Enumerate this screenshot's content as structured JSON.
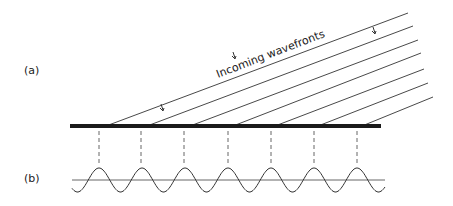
{
  "labels": {
    "a": "(a)",
    "b": "(b)",
    "incoming": "Incoming wavefronts"
  },
  "colors": {
    "line": "#333333",
    "bar": "#1a1a1a"
  },
  "wavefronts": [
    {
      "x1": 106,
      "y1": 126,
      "x2": 408,
      "y2": 13
    },
    {
      "x1": 147,
      "y1": 126,
      "x2": 413,
      "y2": 26
    },
    {
      "x1": 190,
      "y1": 126,
      "x2": 418,
      "y2": 40
    },
    {
      "x1": 233,
      "y1": 126,
      "x2": 421,
      "y2": 53
    },
    {
      "x1": 275,
      "y1": 126,
      "x2": 424,
      "y2": 69
    },
    {
      "x1": 318,
      "y1": 126,
      "x2": 428,
      "y2": 83
    },
    {
      "x1": 362,
      "y1": 126,
      "x2": 433,
      "y2": 97
    }
  ],
  "dashes_x": [
    99,
    141,
    184,
    228,
    271,
    314,
    357
  ]
}
